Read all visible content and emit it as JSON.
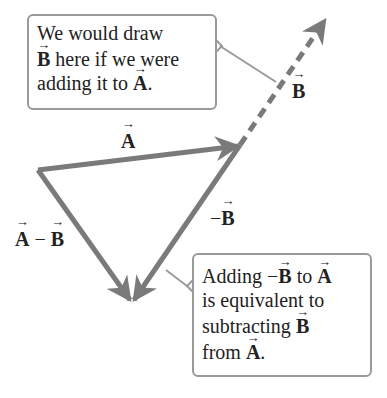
{
  "callout_top": {
    "line1": "We would draw",
    "line2_vec": "B",
    "line2_rest": " here if we were",
    "line3_pre": "adding it to ",
    "line3_vec": "A",
    "line3_end": "."
  },
  "callout_bottom": {
    "l1_pre": "Adding −",
    "l1_vec1": "B",
    "l1_mid": " to ",
    "l1_vec2": "A",
    "l2": "is equivalent to",
    "l3_pre": "subtracting ",
    "l3_vec": "B",
    "l4_pre": "from ",
    "l4_vec": "A",
    "l4_end": "."
  },
  "labels": {
    "A": "A",
    "B": "B",
    "negB_sign": "−",
    "negB": "B",
    "diff_A": "A",
    "diff_op": " − ",
    "diff_B": "B"
  },
  "colors": {
    "vector": "#7a7a7a",
    "callout_border": "#9a9a9a"
  }
}
